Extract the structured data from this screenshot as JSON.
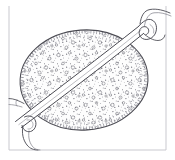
{
  "figure": {
    "title": "Stippled ovoid body with diagonal band and coiled terminus",
    "caption": "",
    "medium": "pen-and-ink line drawing",
    "background_color": "#ffffff",
    "ink_color": "#4a4a52",
    "soft_ink_color": "#7b7b85",
    "frame_color": "#c9c9cf",
    "width": 175,
    "height": 160
  },
  "frame": {
    "name": "panel-border",
    "left_x": 9,
    "right_x": 166,
    "top_y": 6,
    "bottom_y": 150,
    "visible_edges": [
      "left",
      "right",
      "bottom"
    ]
  },
  "parts": [
    {
      "id": "ovoid-body",
      "label": "ovoid body",
      "shape": "ellipse",
      "center_x": 84,
      "center_y": 80,
      "radius_x": 64,
      "radius_y": 50,
      "rotation_deg": -4,
      "texture": "stipple with open vesicles"
    },
    {
      "id": "diagonal-band",
      "label": "diagonal band",
      "shape": "tapered strap",
      "from_x": 18,
      "from_y": 118,
      "to_x": 142,
      "to_y": 30,
      "width_near": 9,
      "width_far": 5
    },
    {
      "id": "upper-coil",
      "label": "coiled terminus",
      "shape": "spiral",
      "center_x": 148,
      "center_y": 28,
      "turns": 2
    },
    {
      "id": "lower-loop",
      "label": "lower loop",
      "shape": "loop",
      "center_x": 30,
      "center_y": 122,
      "turns": 1
    },
    {
      "id": "upper-stalk",
      "label": "upper stalk",
      "shape": "curved filament",
      "from_x": 140,
      "from_y": 22,
      "to_x": 175,
      "to_y": 12
    },
    {
      "id": "lower-tail",
      "label": "lower tail",
      "shape": "curved filament",
      "from_x": 28,
      "from_y": 126,
      "to_x": 40,
      "to_y": 150
    },
    {
      "id": "left-spur",
      "label": "left spur",
      "shape": "short filament",
      "from_x": 22,
      "from_y": 100,
      "to_x": 9,
      "to_y": 97
    }
  ]
}
